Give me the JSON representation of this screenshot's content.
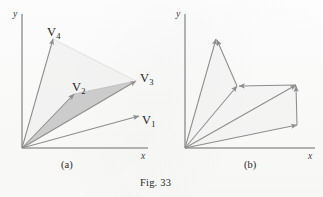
{
  "figure": {
    "caption": "Fig. 33",
    "caption_pos": {
      "x": 140,
      "y": 178
    },
    "background_color": "#fdfdfc",
    "stroke_color": "#8d8d8d",
    "axis_color": "#9a9a9a",
    "shade_fill": "#c9c9c9",
    "shade_fill_light": "#dcdcdc"
  },
  "panels": [
    {
      "id": "a",
      "caption": "(a)",
      "caption_pos": {
        "x": 61,
        "y": 160
      },
      "axes": {
        "origin": {
          "x": 22,
          "y": 148
        },
        "x_end": {
          "x": 148,
          "y": 148
        },
        "y_end": {
          "x": 22,
          "y": 14
        },
        "x_label": "x",
        "y_label": "y",
        "x_label_pos": {
          "x": 141,
          "y": 152
        },
        "y_label_pos": {
          "x": 13,
          "y": 10
        }
      },
      "vectors": [
        {
          "name": "V1",
          "label": "V",
          "subscript": "1",
          "tip": {
            "x": 139,
            "y": 116
          },
          "label_pos": {
            "x": 142,
            "y": 114
          }
        },
        {
          "name": "V2",
          "label": "V",
          "subscript": "2",
          "tip": {
            "x": 74,
            "y": 94
          },
          "label_pos": {
            "x": 72,
            "y": 81
          }
        },
        {
          "name": "V3",
          "label": "V",
          "subscript": "3",
          "tip": {
            "x": 136,
            "y": 81
          },
          "label_pos": {
            "x": 140,
            "y": 72
          }
        },
        {
          "name": "V4",
          "label": "V",
          "subscript": "4",
          "tip": {
            "x": 53,
            "y": 39
          },
          "label_pos": {
            "x": 47,
            "y": 26
          }
        }
      ],
      "shaded_region": {
        "description": "triangle between V2 and V3",
        "points": "22,148 74,94 136,81"
      },
      "faint_region": {
        "description": "triangle between V3 and V4",
        "points": "22,148 136,81 53,39"
      }
    },
    {
      "id": "b",
      "caption": "(b)",
      "caption_pos": {
        "x": 81,
        "y": 160
      },
      "axes": {
        "origin": {
          "x": 22,
          "y": 148
        },
        "x_end": {
          "x": 152,
          "y": 148
        },
        "y_end": {
          "x": 22,
          "y": 14
        },
        "x_label": "x",
        "y_label": "y",
        "x_label_pos": {
          "x": 145,
          "y": 152
        },
        "y_label_pos": {
          "x": 13,
          "y": 10
        }
      },
      "vectors_from_origin": [
        {
          "name": "R1",
          "tip": {
            "x": 134,
            "y": 125
          }
        },
        {
          "name": "R2",
          "tip": {
            "x": 133,
            "y": 85
          }
        },
        {
          "name": "R3",
          "tip": {
            "x": 74,
            "y": 86
          }
        },
        {
          "name": "R4",
          "tip": {
            "x": 53,
            "y": 39
          }
        }
      ],
      "chain_arrows": [
        {
          "name": "chain-1",
          "from": {
            "x": 134,
            "y": 125
          },
          "to": {
            "x": 133,
            "y": 86
          }
        },
        {
          "name": "chain-2",
          "from": {
            "x": 133,
            "y": 85
          },
          "to": {
            "x": 76,
            "y": 86
          }
        },
        {
          "name": "chain-3",
          "from": {
            "x": 74,
            "y": 86
          },
          "to": {
            "x": 54,
            "y": 40
          }
        }
      ],
      "shaded_region": {
        "description": "faint fill under chain",
        "points": "22,148 134,125 133,85 74,86 53,39"
      }
    }
  ]
}
